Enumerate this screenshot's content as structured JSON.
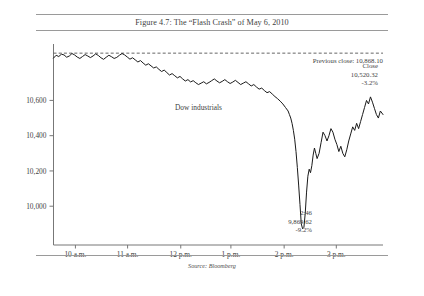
{
  "figure": {
    "title": "Figure 4.7: The “Flash Crash” of May 6, 2010",
    "source": "Source: Bloomberg"
  },
  "annotations": {
    "previous_close": "Previous close: 10,868.10",
    "series_label": "Dow industrials",
    "close_line1": "Close",
    "close_line2": "10,520.32",
    "close_line3": "-3.2%",
    "low_line1": "2:46",
    "low_line2": "9,869.62",
    "low_line3": "-9.2%"
  },
  "axes": {
    "y_ticks": [
      "10,600",
      "10,400",
      "10,200",
      "10,000"
    ],
    "x_ticks": [
      "10 a.m.",
      "11 a.m.",
      "12 p.m.",
      "1 p.m.",
      "2 p.m.",
      "3 p.m."
    ]
  },
  "colors": {
    "line": "#1a1a1a",
    "axis": "#777777",
    "rule": "#9a9a9a",
    "text": "#3f3f3f",
    "dashed": "#555555"
  },
  "chart_data": {
    "type": "line",
    "title": "Figure 4.7: The “Flash Crash” of May 6, 2010",
    "xlabel": "",
    "ylabel": "",
    "grid": false,
    "legend": "none",
    "source": "Source: Bloomberg",
    "ylim": [
      9780,
      10920
    ],
    "xlim": [
      0,
      1
    ],
    "y_tick_values": [
      10600,
      10400,
      10200,
      10000
    ],
    "y_tick_labels": [
      "10,600",
      "10,400",
      "10,200",
      "10,000"
    ],
    "x_tick_positions": [
      0.0665,
      0.2249,
      0.3862,
      0.5384,
      0.7,
      0.8583
    ],
    "x_tick_labels": [
      "10 a.m.",
      "11 a.m.",
      "12 p.m.",
      "1 p.m.",
      "2 p.m.",
      "3 p.m."
    ],
    "reference_line": {
      "label": "Previous close: 10,868.10",
      "value": 10868.1,
      "style": "dashed"
    },
    "annotations": [
      {
        "label": "Dow industrials",
        "x": 0.44,
        "y": 10545
      },
      {
        "label": "Close\n10,520.32\n-3.2%",
        "x": 0.93,
        "y": 10700
      },
      {
        "label": "2:46\n9,869.62\n-9.2%",
        "x": 0.745,
        "y": 9920
      }
    ],
    "series": [
      {
        "name": "Dow industrials",
        "x": [
          0.0,
          0.008,
          0.016,
          0.024,
          0.032,
          0.04,
          0.048,
          0.056,
          0.064,
          0.072,
          0.08,
          0.088,
          0.096,
          0.104,
          0.112,
          0.12,
          0.128,
          0.136,
          0.144,
          0.152,
          0.16,
          0.168,
          0.176,
          0.184,
          0.192,
          0.2,
          0.208,
          0.216,
          0.224,
          0.232,
          0.24,
          0.248,
          0.256,
          0.264,
          0.272,
          0.28,
          0.288,
          0.296,
          0.304,
          0.312,
          0.32,
          0.328,
          0.336,
          0.344,
          0.352,
          0.36,
          0.368,
          0.376,
          0.384,
          0.392,
          0.4,
          0.408,
          0.416,
          0.424,
          0.432,
          0.44,
          0.448,
          0.456,
          0.464,
          0.472,
          0.48,
          0.488,
          0.496,
          0.504,
          0.512,
          0.52,
          0.528,
          0.536,
          0.544,
          0.552,
          0.56,
          0.568,
          0.576,
          0.584,
          0.592,
          0.6,
          0.608,
          0.616,
          0.624,
          0.632,
          0.64,
          0.648,
          0.656,
          0.664,
          0.672,
          0.68,
          0.688,
          0.696,
          0.704,
          0.712,
          0.716,
          0.72,
          0.724,
          0.728,
          0.732,
          0.736,
          0.74,
          0.744,
          0.748,
          0.752,
          0.756,
          0.76,
          0.764,
          0.768,
          0.772,
          0.776,
          0.78,
          0.784,
          0.788,
          0.792,
          0.796,
          0.8,
          0.806,
          0.812,
          0.818,
          0.824,
          0.83,
          0.836,
          0.842,
          0.848,
          0.854,
          0.86,
          0.866,
          0.872,
          0.878,
          0.884,
          0.89,
          0.896,
          0.902,
          0.908,
          0.914,
          0.92,
          0.926,
          0.932,
          0.938,
          0.944,
          0.95,
          0.956,
          0.962,
          0.968,
          0.974,
          0.98,
          0.986,
          0.992,
          1.0
        ],
        "values": [
          10840,
          10856,
          10849,
          10862,
          10858,
          10845,
          10852,
          10866,
          10858,
          10846,
          10838,
          10849,
          10860,
          10852,
          10843,
          10852,
          10864,
          10855,
          10842,
          10833,
          10845,
          10856,
          10848,
          10838,
          10844,
          10856,
          10866,
          10858,
          10846,
          10834,
          10842,
          10830,
          10818,
          10826,
          10812,
          10800,
          10808,
          10796,
          10784,
          10790,
          10776,
          10764,
          10772,
          10758,
          10744,
          10752,
          10740,
          10728,
          10736,
          10722,
          10710,
          10718,
          10705,
          10712,
          10700,
          10690,
          10698,
          10706,
          10694,
          10702,
          10712,
          10722,
          10710,
          10700,
          10708,
          10718,
          10706,
          10696,
          10704,
          10714,
          10702,
          10690,
          10698,
          10706,
          10694,
          10682,
          10690,
          10676,
          10664,
          10670,
          10656,
          10644,
          10650,
          10636,
          10622,
          10610,
          10596,
          10580,
          10560,
          10540,
          10520,
          10500,
          10470,
          10430,
          10380,
          10310,
          10220,
          10120,
          10010,
          9900,
          9872,
          9880,
          9960,
          10080,
          10170,
          10210,
          10190,
          10230,
          10290,
          10330,
          10300,
          10270,
          10300,
          10360,
          10420,
          10400,
          10370,
          10400,
          10440,
          10420,
          10380,
          10350,
          10310,
          10340,
          10300,
          10280,
          10320,
          10370,
          10410,
          10450,
          10430,
          10470,
          10440,
          10480,
          10520,
          10560,
          10600,
          10580,
          10620,
          10590,
          10555,
          10520,
          10500,
          10540,
          10520
        ]
      }
    ]
  }
}
